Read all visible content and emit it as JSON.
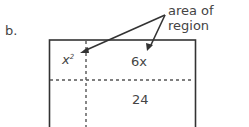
{
  "part_label": "b.",
  "annotation": "area of region",
  "regions": {
    "top_left": "x",
    "top_left_exp": "2",
    "top_right": "6x",
    "bottom_right": "24"
  }
}
